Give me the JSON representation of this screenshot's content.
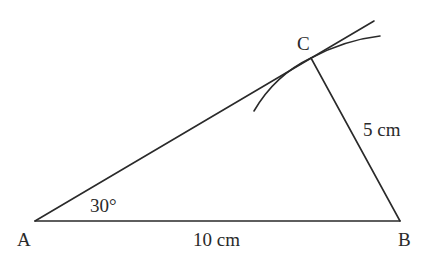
{
  "diagram": {
    "type": "triangle-construction",
    "points": {
      "A": {
        "label": "A",
        "x": 35,
        "y": 221
      },
      "B": {
        "label": "B",
        "x": 400,
        "y": 221
      },
      "C": {
        "label": "C",
        "x": 311,
        "y": 58
      }
    },
    "labels": {
      "angle_A": "30°",
      "side_AB": "10 cm",
      "side_BC": "5 cm"
    },
    "construction": {
      "ray_from_A_extended_to": {
        "x": 374,
        "y": 21
      },
      "arc_center": "B",
      "arc_radius_label": "5 cm"
    },
    "colors": {
      "stroke": "#2a2a2a",
      "background": "#ffffff"
    }
  }
}
